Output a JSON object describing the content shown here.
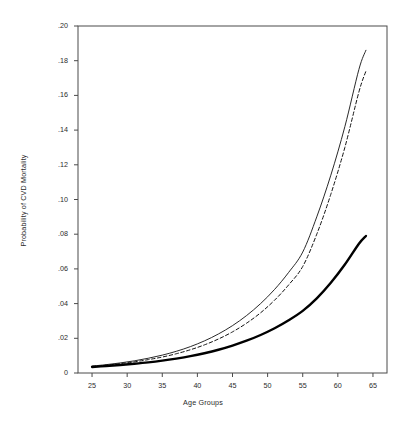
{
  "chart_data": {
    "type": "line",
    "title": "",
    "xlabel": "Age Groups",
    "ylabel": "Probability of CVD Mortality",
    "xlim": [
      23,
      67
    ],
    "ylim": [
      0,
      0.2
    ],
    "grid": false,
    "legend": "none",
    "xticks": [
      25,
      30,
      35,
      40,
      45,
      50,
      55,
      60,
      65
    ],
    "xtick_labels": [
      "25",
      "30",
      "35",
      "40",
      "45",
      "50",
      "55",
      "60",
      "65"
    ],
    "yticks": [
      0,
      0.02,
      0.04,
      0.06,
      0.08,
      0.1,
      0.12,
      0.14,
      0.16,
      0.18,
      0.2
    ],
    "ytick_labels": [
      "0",
      ".02",
      ".04",
      ".06",
      ".08",
      ".10",
      ".12",
      ".14",
      ".16",
      ".18",
      ".20"
    ],
    "x": [
      25,
      27,
      29,
      31,
      33,
      35,
      37,
      39,
      41,
      43,
      45,
      47,
      49,
      51,
      53,
      55,
      57,
      59,
      61,
      63,
      64
    ],
    "series": [
      {
        "name": "thin-solid-curve",
        "style": "solid",
        "width": 0.9,
        "color": "#111111",
        "values": [
          0.004,
          0.0048,
          0.0058,
          0.007,
          0.0085,
          0.0103,
          0.0125,
          0.0152,
          0.0185,
          0.0225,
          0.0273,
          0.0331,
          0.04,
          0.0482,
          0.058,
          0.0697,
          0.09,
          0.114,
          0.142,
          0.175,
          0.186
        ]
      },
      {
        "name": "dashed-curve",
        "style": "dashed",
        "width": 1.0,
        "color": "#111111",
        "values": [
          0.0038,
          0.0045,
          0.0054,
          0.0064,
          0.0077,
          0.0092,
          0.0111,
          0.0134,
          0.0162,
          0.0196,
          0.0237,
          0.0287,
          0.0347,
          0.042,
          0.0508,
          0.0614,
          0.08,
          0.103,
          0.13,
          0.162,
          0.174
        ]
      },
      {
        "name": "thick-solid-curve",
        "style": "solid",
        "width": 2.4,
        "color": "#000000",
        "values": [
          0.0035,
          0.004,
          0.0046,
          0.0053,
          0.0061,
          0.0071,
          0.0083,
          0.0097,
          0.0114,
          0.0134,
          0.0158,
          0.0186,
          0.0219,
          0.0258,
          0.0304,
          0.0358,
          0.043,
          0.052,
          0.0625,
          0.0745,
          0.079
        ]
      }
    ]
  },
  "figure": {
    "frame_color": "#4a4a4a",
    "background": "#ffffff"
  }
}
